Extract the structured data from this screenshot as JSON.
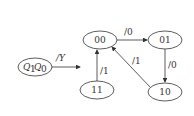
{
  "diagram": {
    "type": "state-transition",
    "legend": {
      "node_label_q1": "Q",
      "node_sub_1": "1",
      "node_label_q0": "Q",
      "node_sub_0": "0",
      "arrow_label": "/Y"
    },
    "states": [
      {
        "id": "00",
        "label": "00"
      },
      {
        "id": "01",
        "label": "01"
      },
      {
        "id": "10",
        "label": "10"
      },
      {
        "id": "11",
        "label": "11"
      }
    ],
    "transitions": [
      {
        "from": "00",
        "to": "01",
        "label": "/0"
      },
      {
        "from": "01",
        "to": "10",
        "label": "/0"
      },
      {
        "from": "10",
        "to": "00",
        "label": "/1"
      },
      {
        "from": "11",
        "to": "00",
        "label": "/1"
      }
    ]
  },
  "colors": {
    "stroke": "#333333",
    "background": "#ffffff"
  }
}
